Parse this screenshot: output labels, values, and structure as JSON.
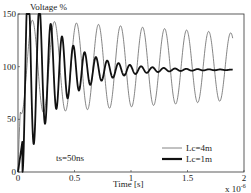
{
  "chart_data": {
    "type": "line",
    "title": "",
    "ylabel": "Voltage %",
    "xlabel": "Time [s]",
    "x_multiplier": "x 10^-6",
    "xlim": [
      0,
      2
    ],
    "ylim": [
      0,
      150
    ],
    "x_ticks": [
      "0",
      "0.5",
      "1",
      "1.5",
      "2"
    ],
    "y_ticks": [
      "0",
      "50",
      "100",
      "150"
    ],
    "grid": false,
    "legend_position": "lower right",
    "annotation": "ts=50ns",
    "series": [
      {
        "name": "Lc=4m",
        "style": "thin",
        "color": "#666666",
        "description": "undamped-like oscillation around 100%, period ~0.195e-6 s, peaks ~140-145%, troughs rising from ~15% to ~70%",
        "rise_end_x": 0.13,
        "period": 0.195,
        "offset": 100,
        "amplitude_start": 45,
        "amplitude_end": 32,
        "end_x": 1.9
      },
      {
        "name": "Lc=1m",
        "style": "thick",
        "color": "#111111",
        "description": "damped oscillation settling to ~97%, first peak ~137% at t~0.09",
        "rise_end_x": 0.09,
        "period": 0.095,
        "offset": 97,
        "amplitude_start": 40,
        "decay": 3.2,
        "end_x": 1.9
      }
    ]
  }
}
